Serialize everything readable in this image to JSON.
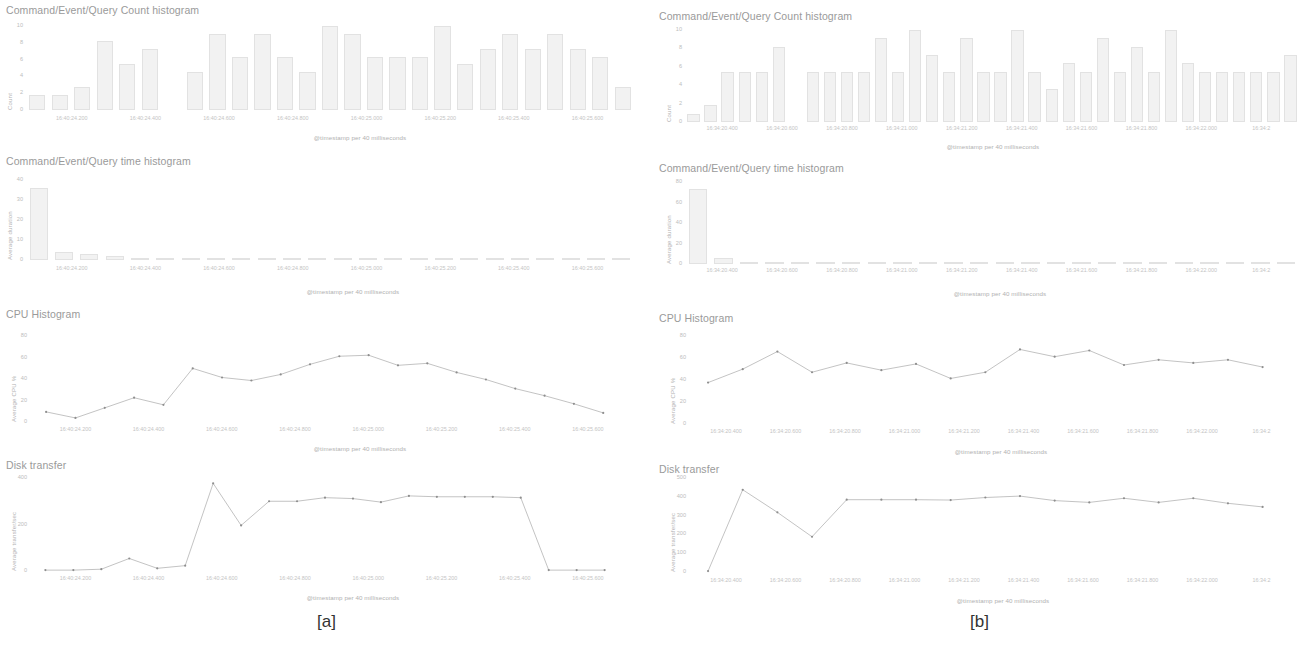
{
  "figure": {
    "panels": [
      {
        "caption": "[a]",
        "xlabel": "@timestamp per 40 milliseconds",
        "xticks": [
          "16:40:24.200",
          "16:40:24.400",
          "16:40:24.600",
          "16:40:24.800",
          "16:40:25.000",
          "16:40:25.200",
          "16:40:25.400",
          "16:40:25.600"
        ],
        "charts": [
          {
            "title": "Command/Event/Query Count histogram",
            "ylabel": "Count",
            "yticks": [
              "10",
              "8",
              "6",
              "4",
              "2",
              "0"
            ]
          },
          {
            "title": "Command/Event/Query time histogram",
            "ylabel": "Average duration",
            "yticks": [
              "40",
              "30",
              "20",
              "10",
              "0"
            ]
          },
          {
            "title": "CPU Histogram",
            "ylabel": "Average CPU %",
            "yticks": [
              "80",
              "60",
              "40",
              "20",
              "0"
            ]
          },
          {
            "title": "Disk transfer",
            "ylabel": "Average transfer/sec",
            "yticks": [
              "400",
              "200",
              "0"
            ]
          }
        ]
      },
      {
        "caption": "[b]",
        "xlabel": "@timestamp per 40 milliseconds",
        "xticks": [
          "16:34:20.400",
          "16:34:20.600",
          "16:34:20.800",
          "16:34:21.000",
          "16:34:21.200",
          "16:34:21.400",
          "16:34:21.600",
          "16:34:21.800",
          "16:34:22.000",
          "16:34:2"
        ],
        "charts": [
          {
            "title": "Command/Event/Query Count histogram",
            "ylabel": "Count",
            "yticks": [
              "10",
              "8",
              "6",
              "4",
              "2",
              "0"
            ]
          },
          {
            "title": "Command/Event/Query time histogram",
            "ylabel": "Average duration",
            "yticks": [
              "80",
              "60",
              "40",
              "20",
              "0"
            ]
          },
          {
            "title": "CPU Histogram",
            "ylabel": "Average CPU %",
            "yticks": [
              "80",
              "60",
              "40",
              "20",
              "0"
            ]
          },
          {
            "title": "Disk transfer",
            "ylabel": "Average transfer/sec",
            "yticks": [
              "500",
              "400",
              "300",
              "200",
              "100",
              "0"
            ]
          }
        ]
      }
    ]
  },
  "chart_data": [
    {
      "panel": "[a]",
      "index": 0,
      "type": "bar",
      "title": "Command/Event/Query Count histogram",
      "xlabel": "@timestamp per 40 milliseconds",
      "ylabel": "Count",
      "ylim": [
        0,
        11
      ],
      "grid": false,
      "xtick_labels": [
        "16:40:24.200",
        "16:40:24.400",
        "16:40:24.600",
        "16:40:24.800",
        "16:40:25.000",
        "16:40:25.200",
        "16:40:25.400",
        "16:40:25.600"
      ],
      "bar_positions": [
        0.288,
        0.32,
        0.352,
        0.384,
        0.416,
        0.448,
        0.48,
        0.545,
        0.577,
        0.609,
        0.641,
        0.673,
        0.705,
        0.737,
        0.769,
        0.801,
        0.833,
        0.865,
        0.897,
        0.929,
        0.961
      ],
      "values": [
        2,
        2,
        3,
        9,
        6,
        8,
        0,
        5,
        10,
        7,
        10,
        7,
        5,
        11,
        10,
        7,
        7,
        7,
        11,
        6,
        8,
        10,
        8,
        10,
        8,
        7,
        3
      ]
    },
    {
      "panel": "[a]",
      "index": 1,
      "type": "bar",
      "title": "Command/Event/Query time histogram",
      "xlabel": "@timestamp per 40 milliseconds",
      "ylabel": "Average duration",
      "ylim": [
        0,
        42
      ],
      "grid": false,
      "xtick_labels": [
        "16:40:24.200",
        "16:40:24.400",
        "16:40:24.600",
        "16:40:24.800",
        "16:40:25.000",
        "16:40:25.200",
        "16:40:25.400",
        "16:40:25.600"
      ],
      "values": [
        38,
        4,
        3,
        2,
        1,
        1,
        1,
        1,
        1,
        1,
        1,
        1,
        1,
        1,
        1,
        1,
        1,
        1,
        1,
        1,
        1,
        1,
        1,
        1
      ]
    },
    {
      "panel": "[a]",
      "index": 2,
      "type": "line",
      "title": "CPU Histogram",
      "xlabel": "@timestamp per 40 milliseconds",
      "ylabel": "Average CPU %",
      "ylim": [
        0,
        85
      ],
      "grid": false,
      "xtick_labels": [
        "16:40:24.200",
        "16:40:24.400",
        "16:40:24.600",
        "16:40:24.800",
        "16:40:25.000",
        "16:40:25.200",
        "16:40:25.400",
        "16:40:25.600"
      ],
      "values": [
        10,
        4,
        14,
        24,
        17,
        53,
        44,
        41,
        47,
        57,
        65,
        66,
        56,
        58,
        49,
        42,
        33,
        26,
        18,
        9
      ]
    },
    {
      "panel": "[a]",
      "index": 3,
      "type": "line",
      "title": "Disk transfer",
      "xlabel": "@timestamp per 40 milliseconds",
      "ylabel": "Average transfer/sec",
      "ylim": [
        0,
        520
      ],
      "grid": false,
      "xtick_labels": [
        "16:40:24.200",
        "16:40:24.400",
        "16:40:24.600",
        "16:40:24.800",
        "16:40:25.000",
        "16:40:25.200",
        "16:40:25.400",
        "16:40:25.600"
      ],
      "values": [
        5,
        5,
        10,
        70,
        15,
        30,
        490,
        255,
        390,
        390,
        410,
        405,
        385,
        420,
        415,
        415,
        415,
        410,
        5,
        5,
        5
      ]
    },
    {
      "panel": "[b]",
      "index": 0,
      "type": "bar",
      "title": "Command/Event/Query Count histogram",
      "xlabel": "@timestamp per 40 milliseconds",
      "ylabel": "Count",
      "ylim": [
        0,
        11
      ],
      "grid": false,
      "xtick_labels": [
        "16:34:20.400",
        "16:34:20.600",
        "16:34:20.800",
        "16:34:21.000",
        "16:34:21.200",
        "16:34:21.400",
        "16:34:21.600",
        "16:34:21.800",
        "16:34:22.000"
      ],
      "values": [
        1,
        2,
        6,
        6,
        6,
        9,
        0,
        6,
        6,
        6,
        6,
        10,
        6,
        11,
        8,
        6,
        10,
        6,
        6,
        11,
        6,
        4,
        7,
        6,
        10,
        6,
        9,
        6,
        11,
        7,
        6,
        6,
        6,
        6,
        6,
        8
      ]
    },
    {
      "panel": "[b]",
      "index": 1,
      "type": "bar",
      "title": "Command/Event/Query time histogram",
      "xlabel": "@timestamp per 40 milliseconds",
      "ylabel": "Average duration",
      "ylim": [
        0,
        85
      ],
      "grid": false,
      "xtick_labels": [
        "16:34:20.400",
        "16:34:20.600",
        "16:34:20.800",
        "16:34:21.000",
        "16:34:21.200",
        "16:34:21.400",
        "16:34:21.600",
        "16:34:21.800",
        "16:34:22.000"
      ],
      "values": [
        78,
        6,
        2,
        1,
        1,
        1,
        1,
        1,
        1,
        1,
        1,
        1,
        1,
        1,
        1,
        1,
        1,
        1,
        1,
        1,
        1,
        1,
        1,
        1
      ]
    },
    {
      "panel": "[b]",
      "index": 2,
      "type": "line",
      "title": "CPU Histogram",
      "xlabel": "@timestamp per 40 milliseconds",
      "ylabel": "Average CPU %",
      "ylim": [
        0,
        85
      ],
      "grid": false,
      "xtick_labels": [
        "16:34:20.400",
        "16:34:20.600",
        "16:34:20.800",
        "16:34:21.000",
        "16:34:21.200",
        "16:34:21.400",
        "16:34:21.600",
        "16:34:21.800",
        "16:34:22.000"
      ],
      "values": [
        40,
        53,
        70,
        50,
        59,
        52,
        58,
        44,
        50,
        72,
        65,
        71,
        57,
        62,
        59,
        62,
        55
      ]
    },
    {
      "panel": "[b]",
      "index": 3,
      "type": "line",
      "title": "Disk transfer",
      "xlabel": "@timestamp per 40 milliseconds",
      "ylabel": "Average transfer/sec",
      "ylim": [
        0,
        520
      ],
      "grid": false,
      "xtick_labels": [
        "16:34:20.400",
        "16:34:20.600",
        "16:34:20.800",
        "16:34:21.000",
        "16:34:21.200",
        "16:34:21.400",
        "16:34:21.600",
        "16:34:21.800",
        "16:34:22.000"
      ],
      "values": [
        5,
        455,
        330,
        195,
        400,
        400,
        400,
        398,
        412,
        420,
        395,
        385,
        408,
        385,
        408,
        380,
        360
      ]
    }
  ],
  "layout": {
    "panel_geometry": [
      {
        "caption_top": 612,
        "blocks": [
          {
            "top": 4,
            "title_x": 6,
            "plot_x": 26,
            "plot_y": 26,
            "plot_w": 608,
            "plot_h": 84,
            "xtick_y": 116,
            "xlabel_y": 134,
            "xlabel_x": 360
          },
          {
            "top": 155,
            "title_x": 6,
            "plot_x": 26,
            "plot_y": 180,
            "plot_w": 608,
            "plot_h": 80,
            "xtick_y": 266,
            "xlabel_y": 288,
            "xlabel_x": 353
          },
          {
            "top": 308,
            "title_x": 6,
            "plot_x": 30,
            "plot_y": 336,
            "plot_w": 604,
            "plot_h": 86,
            "xtick_y": 427,
            "xlabel_y": 445,
            "xlabel_x": 360
          },
          {
            "top": 459,
            "title_x": 6,
            "plot_x": 30,
            "plot_y": 478,
            "plot_w": 604,
            "plot_h": 93,
            "xtick_y": 576,
            "xlabel_y": 594,
            "xlabel_x": 353
          }
        ]
      },
      {
        "caption_top": 612,
        "blocks": [
          {
            "top": 10,
            "title_x": 6,
            "plot_x": 32,
            "plot_y": 30,
            "plot_w": 614,
            "plot_h": 92,
            "xtick_y": 126,
            "xlabel_y": 143,
            "xlabel_x": 340
          },
          {
            "top": 162,
            "title_x": 6,
            "plot_x": 32,
            "plot_y": 182,
            "plot_w": 614,
            "plot_h": 82,
            "xtick_y": 268,
            "xlabel_y": 290,
            "xlabel_x": 347
          },
          {
            "top": 312,
            "title_x": 6,
            "plot_x": 36,
            "plot_y": 336,
            "plot_w": 610,
            "plot_h": 88,
            "xtick_y": 429,
            "xlabel_y": 448,
            "xlabel_x": 348
          },
          {
            "top": 463,
            "title_x": 6,
            "plot_x": 36,
            "plot_y": 478,
            "plot_w": 610,
            "plot_h": 94,
            "xtick_y": 578,
            "xlabel_y": 597,
            "xlabel_x": 350
          }
        ]
      }
    ]
  }
}
